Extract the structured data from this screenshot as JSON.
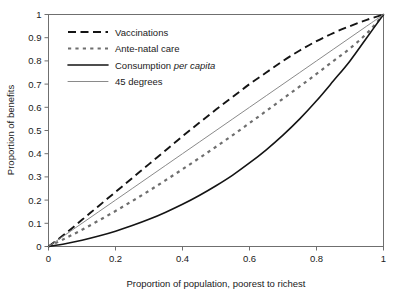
{
  "chart_data": {
    "type": "line",
    "title": "",
    "xlabel": "Proportion of population, poorest to richest",
    "ylabel": "Proportion of benefits",
    "xlim": [
      0,
      1
    ],
    "ylim": [
      0,
      1
    ],
    "grid": false,
    "legend_position": "upper-left-inside",
    "xticks": [
      "0",
      "0.2",
      "0.4",
      "0.6",
      "0.8",
      "1"
    ],
    "xtick_values": [
      0,
      0.2,
      0.4,
      0.6,
      0.8,
      1
    ],
    "yticks": [
      "0",
      "0.1",
      "0.2",
      "0.3",
      "0.4",
      "0.5",
      "0.6",
      "0.7",
      "0.8",
      "0.9",
      "1"
    ],
    "ytick_values": [
      0,
      0.1,
      0.2,
      0.3,
      0.4,
      0.5,
      0.6,
      0.7,
      0.8,
      0.9,
      1
    ],
    "x": [
      0,
      0.05,
      0.1,
      0.15,
      0.2,
      0.25,
      0.3,
      0.35,
      0.4,
      0.45,
      0.5,
      0.55,
      0.6,
      0.65,
      0.7,
      0.75,
      0.8,
      0.85,
      0.9,
      0.95,
      1
    ],
    "series": [
      {
        "name": "Vaccinations",
        "style": "long-dash",
        "color": "#141414",
        "values": [
          0,
          0.055,
          0.115,
          0.175,
          0.235,
          0.295,
          0.355,
          0.415,
          0.475,
          0.533,
          0.59,
          0.645,
          0.7,
          0.75,
          0.8,
          0.845,
          0.885,
          0.92,
          0.95,
          0.977,
          1
        ]
      },
      {
        "name": "Ante-natal care",
        "style": "short-dash",
        "color": "#6e6e6e",
        "values": [
          0,
          0.035,
          0.072,
          0.112,
          0.153,
          0.196,
          0.24,
          0.286,
          0.333,
          0.381,
          0.43,
          0.48,
          0.532,
          0.584,
          0.637,
          0.69,
          0.744,
          0.799,
          0.854,
          0.918,
          1
        ]
      },
      {
        "name": "Consumption per capita",
        "name_plain": "Consumption",
        "name_italic": "per capita",
        "style": "solid",
        "color": "#141414",
        "values": [
          0,
          0.012,
          0.027,
          0.045,
          0.066,
          0.09,
          0.117,
          0.148,
          0.182,
          0.22,
          0.262,
          0.308,
          0.36,
          0.417,
          0.48,
          0.55,
          0.628,
          0.713,
          0.8,
          0.9,
          1
        ]
      },
      {
        "name": "45 degrees",
        "style": "thin-solid",
        "color": "#8a8a8a",
        "values": [
          0,
          0.05,
          0.1,
          0.15,
          0.2,
          0.25,
          0.3,
          0.35,
          0.4,
          0.45,
          0.5,
          0.55,
          0.6,
          0.65,
          0.7,
          0.75,
          0.8,
          0.85,
          0.9,
          0.95,
          1
        ]
      }
    ]
  },
  "legend": {
    "items": [
      {
        "label": "Vaccinations"
      },
      {
        "label": "Ante-natal care"
      },
      {
        "label": "Consumption per capita"
      },
      {
        "label": "45 degrees"
      }
    ]
  }
}
